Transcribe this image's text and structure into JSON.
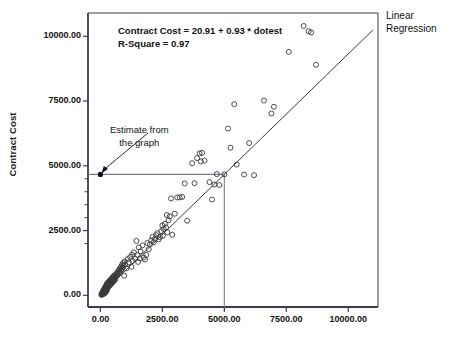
{
  "chart_data": {
    "type": "scatter",
    "title": "",
    "xlabel": "",
    "ylabel": "Contract Cost",
    "xlim": [
      -500,
      11200
    ],
    "ylim": [
      -450,
      10900
    ],
    "grid": false,
    "legend_position": "top-right",
    "legend_entries": [
      "Linear Regression"
    ],
    "xticks": [
      0,
      2500,
      5000,
      7500,
      10000
    ],
    "xticklabels": [
      "0.00",
      "2500.00",
      "5000.00",
      "7500.00",
      "10000.00"
    ],
    "yticks": [
      0,
      2500,
      5000,
      7500,
      10000
    ],
    "yticklabels": [
      "0.00",
      "2500.00",
      "5000.00",
      "7500.00",
      "10000.00"
    ],
    "fit": {
      "intercept": 20.91,
      "slope": 0.93,
      "r_square": 0.97,
      "equation_text": "Contract Cost = 20.91 + 0.93 * dotest",
      "rsquare_text": "R-Square = 0.97"
    },
    "annotations": [
      {
        "text_line1": "Estimate from",
        "text_line2": "the graph",
        "points_to_x": 0,
        "points_to_y": 4670
      }
    ],
    "guide_lines": {
      "vertical_x": 5000,
      "horizontal_y": 4670,
      "color": "#7d7a93"
    },
    "estimate_marker": {
      "x": 0,
      "y": 4670
    },
    "series": [
      {
        "name": "dotest vs Contract Cost",
        "marker": "open-circle",
        "points": [
          [
            40,
            30
          ],
          [
            55,
            20
          ],
          [
            60,
            75
          ],
          [
            70,
            45
          ],
          [
            80,
            110
          ],
          [
            85,
            60
          ],
          [
            95,
            130
          ],
          [
            100,
            70
          ],
          [
            105,
            160
          ],
          [
            110,
            95
          ],
          [
            115,
            55
          ],
          [
            120,
            180
          ],
          [
            125,
            120
          ],
          [
            130,
            85
          ],
          [
            135,
            200
          ],
          [
            140,
            150
          ],
          [
            145,
            105
          ],
          [
            150,
            230
          ],
          [
            155,
            175
          ],
          [
            160,
            125
          ],
          [
            165,
            70
          ],
          [
            170,
            260
          ],
          [
            175,
            195
          ],
          [
            180,
            140
          ],
          [
            185,
            290
          ],
          [
            190,
            220
          ],
          [
            195,
            165
          ],
          [
            200,
            320
          ],
          [
            205,
            250
          ],
          [
            210,
            185
          ],
          [
            215,
            110
          ],
          [
            220,
            350
          ],
          [
            225,
            275
          ],
          [
            230,
            210
          ],
          [
            235,
            380
          ],
          [
            240,
            300
          ],
          [
            245,
            235
          ],
          [
            250,
            410
          ],
          [
            255,
            330
          ],
          [
            260,
            260
          ],
          [
            265,
            190
          ],
          [
            270,
            440
          ],
          [
            275,
            355
          ],
          [
            280,
            285
          ],
          [
            285,
            470
          ],
          [
            290,
            385
          ],
          [
            300,
            310
          ],
          [
            310,
            500
          ],
          [
            320,
            415
          ],
          [
            330,
            340
          ],
          [
            340,
            530
          ],
          [
            350,
            445
          ],
          [
            360,
            370
          ],
          [
            370,
            560
          ],
          [
            380,
            475
          ],
          [
            390,
            400
          ],
          [
            400,
            590
          ],
          [
            410,
            505
          ],
          [
            420,
            430
          ],
          [
            430,
            620
          ],
          [
            440,
            535
          ],
          [
            450,
            465
          ],
          [
            460,
            655
          ],
          [
            470,
            565
          ],
          [
            480,
            495
          ],
          [
            490,
            685
          ],
          [
            500,
            600
          ],
          [
            510,
            525
          ],
          [
            520,
            720
          ],
          [
            530,
            630
          ],
          [
            540,
            555
          ],
          [
            550,
            750
          ],
          [
            560,
            660
          ],
          [
            570,
            585
          ],
          [
            580,
            785
          ],
          [
            590,
            690
          ],
          [
            600,
            615
          ],
          [
            620,
            720
          ],
          [
            640,
            820
          ],
          [
            660,
            750
          ],
          [
            680,
            880
          ],
          [
            700,
            790
          ],
          [
            720,
            940
          ],
          [
            740,
            850
          ],
          [
            760,
            1000
          ],
          [
            780,
            900
          ],
          [
            800,
            1060
          ],
          [
            820,
            960
          ],
          [
            840,
            1120
          ],
          [
            860,
            1010
          ],
          [
            880,
            1190
          ],
          [
            900,
            1070
          ],
          [
            920,
            1250
          ],
          [
            940,
            1130
          ],
          [
            960,
            760
          ],
          [
            980,
            1310
          ],
          [
            1000,
            1190
          ],
          [
            1050,
            1040
          ],
          [
            1100,
            1400
          ],
          [
            1150,
            1270
          ],
          [
            1200,
            1480
          ],
          [
            1250,
            1100
          ],
          [
            1280,
            1570
          ],
          [
            1300,
            1330
          ],
          [
            1350,
            1660
          ],
          [
            1400,
            1410
          ],
          [
            1450,
            2100
          ],
          [
            1500,
            1560
          ],
          [
            1520,
            1290
          ],
          [
            1550,
            1850
          ],
          [
            1600,
            1420
          ],
          [
            1620,
            1700
          ],
          [
            1700,
            1930
          ],
          [
            1750,
            1460
          ],
          [
            1800,
            1380
          ],
          [
            1850,
            1560
          ],
          [
            1900,
            2020
          ],
          [
            1950,
            1780
          ],
          [
            2000,
            1970
          ],
          [
            2050,
            2120
          ],
          [
            2100,
            2260
          ],
          [
            2150,
            2050
          ],
          [
            2200,
            2180
          ],
          [
            2250,
            2320
          ],
          [
            2300,
            2400
          ],
          [
            2350,
            2160
          ],
          [
            2400,
            2250
          ],
          [
            2450,
            2480
          ],
          [
            2500,
            2700
          ],
          [
            2520,
            2300
          ],
          [
            2550,
            2560
          ],
          [
            2600,
            2760
          ],
          [
            2650,
            2620
          ],
          [
            2680,
            3100
          ],
          [
            2700,
            2430
          ],
          [
            2750,
            2900
          ],
          [
            2800,
            3050
          ],
          [
            2850,
            3740
          ],
          [
            2900,
            2340
          ],
          [
            3000,
            3150
          ],
          [
            3100,
            3780
          ],
          [
            3200,
            3780
          ],
          [
            3300,
            3800
          ],
          [
            3400,
            4320
          ],
          [
            3500,
            2880
          ],
          [
            3700,
            5100
          ],
          [
            3800,
            4330
          ],
          [
            3900,
            5300
          ],
          [
            4000,
            5480
          ],
          [
            4050,
            5170
          ],
          [
            4100,
            5500
          ],
          [
            4200,
            5200
          ],
          [
            4400,
            4370
          ],
          [
            4500,
            3700
          ],
          [
            4600,
            4280
          ],
          [
            4700,
            4680
          ],
          [
            4800,
            4260
          ],
          [
            5000,
            4670
          ],
          [
            5150,
            6440
          ],
          [
            5250,
            5700
          ],
          [
            5400,
            7380
          ],
          [
            5500,
            5050
          ],
          [
            5800,
            4660
          ],
          [
            6000,
            5880
          ],
          [
            6200,
            4640
          ],
          [
            6600,
            7520
          ],
          [
            6900,
            7020
          ],
          [
            7000,
            7280
          ],
          [
            7600,
            9400
          ],
          [
            8200,
            10400
          ],
          [
            8400,
            10200
          ],
          [
            8500,
            10150
          ],
          [
            8700,
            8900
          ]
        ]
      }
    ]
  },
  "axes": {
    "y_title": "Contract Cost"
  },
  "legend": {
    "line1": "Linear",
    "line2": "Regression"
  },
  "annotation": {
    "line1": "Estimate from",
    "line2": "the graph"
  },
  "equation": {
    "line1": "Contract Cost = 20.91 + 0.93 * dotest",
    "line2": "R-Square = 0.97"
  },
  "colors": {
    "axis": "#3b3b55",
    "marker": "#3a3a3a",
    "fit_line": "#3a3a3a",
    "guide": "#7d7a93",
    "text": "#111111"
  }
}
